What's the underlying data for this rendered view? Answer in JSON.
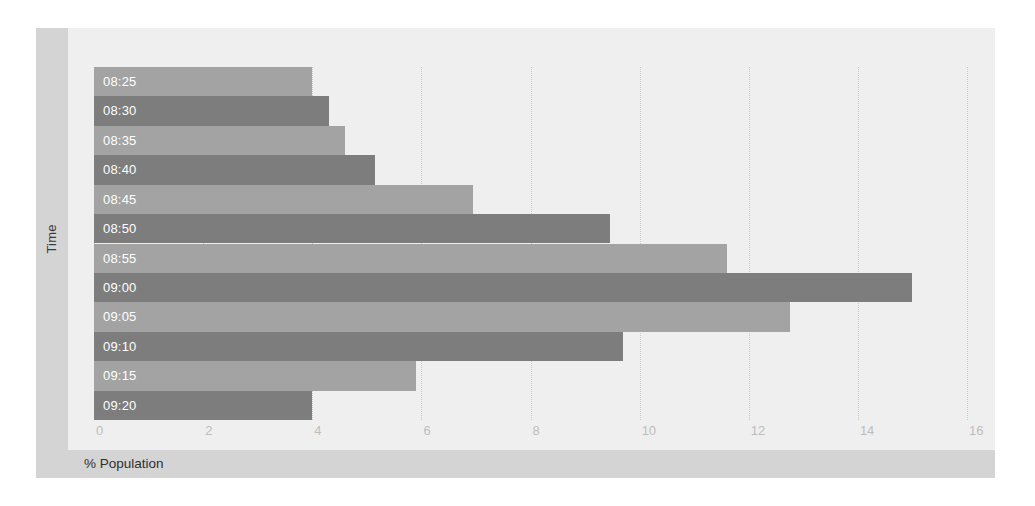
{
  "chart_data": {
    "type": "bar",
    "orientation": "horizontal",
    "title": "",
    "xlabel": "% Population",
    "ylabel": "Time",
    "categories": [
      "08:25",
      "08:30",
      "08:35",
      "08:40",
      "08:45",
      "08:50",
      "08:55",
      "09:00",
      "09:05",
      "09:10",
      "09:15",
      "09:20"
    ],
    "values": [
      4.0,
      4.3,
      4.6,
      5.15,
      6.95,
      9.45,
      11.6,
      15.0,
      12.75,
      9.7,
      5.9,
      4.0
    ],
    "xlim": [
      0,
      16
    ],
    "xticks": [
      0,
      2,
      4,
      6,
      8,
      10,
      12,
      14,
      16
    ],
    "xtick_labels": [
      "0",
      "2",
      "4",
      "6",
      "8",
      "10",
      "12",
      "14",
      "16"
    ],
    "grid": "vertical-dotted",
    "legend": "none",
    "bar_colors": [
      "#a3a3a3",
      "#7d7d7d"
    ],
    "label_color": "#ffffff",
    "plot_background": "#efefef",
    "band_color": "#d4d4d4"
  }
}
